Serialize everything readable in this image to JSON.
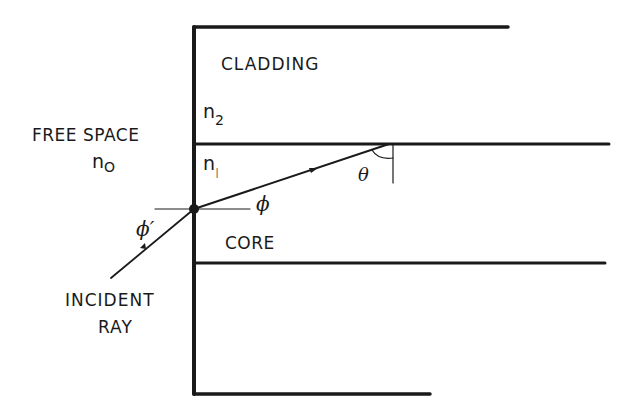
{
  "diagram": {
    "regions": {
      "cladding": "CLADDING",
      "core": "CORE",
      "free_space": "FREE SPACE"
    },
    "indices": {
      "n0": {
        "base": "n",
        "sub": "O"
      },
      "n1": {
        "base": "n",
        "sub": "I"
      },
      "n2": {
        "base": "n",
        "sub": "2"
      }
    },
    "angles": {
      "phi_prime": "ϕ′",
      "phi": "ϕ",
      "theta": "θ"
    },
    "incident": {
      "line1": "INCIDENT",
      "line2": "RAY"
    },
    "colors": {
      "ink": "#1a1a1a",
      "background": "#ffffff"
    }
  }
}
